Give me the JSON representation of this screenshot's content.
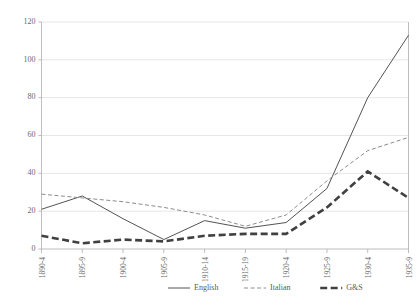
{
  "chart_data": {
    "type": "line",
    "title": "",
    "xlabel": "",
    "ylabel": "",
    "ylim": [
      0,
      120
    ],
    "yticks": [
      0,
      20,
      40,
      60,
      80,
      100,
      120
    ],
    "grid": true,
    "legend_position": "bottom",
    "categories": [
      "1890-4",
      "1895-9",
      "1900-4",
      "1905-9",
      "1910-14",
      "1915-19",
      "1920-4",
      "1925-9",
      "1930-4",
      "1935-9"
    ],
    "series": [
      {
        "name": "English",
        "style": "solid",
        "color": "#404040",
        "values": [
          21,
          28,
          16,
          5,
          15,
          11,
          14,
          32,
          80,
          113
        ]
      },
      {
        "name": "Italian",
        "style": "dashed",
        "color": "#8c8c8c",
        "values": [
          29,
          27,
          25,
          22,
          18,
          12,
          18,
          36,
          52,
          59
        ]
      },
      {
        "name": "G&S",
        "style": "thick-dashed",
        "color": "#404040",
        "values": [
          7,
          3,
          5,
          4,
          7,
          8,
          8,
          22,
          41,
          27
        ]
      }
    ]
  },
  "axes": {
    "y_tick_labels": [
      "0",
      "20",
      "40",
      "60",
      "80",
      "100",
      "120"
    ],
    "x_tick_labels": [
      "1890-4",
      "1895-9",
      "1900-4",
      "1905-9",
      "1910-14",
      "1915-19",
      "1920-4",
      "1925-9",
      "1930-4",
      "1935-9"
    ]
  },
  "legend": {
    "entries": [
      {
        "label": "English",
        "style": "solid"
      },
      {
        "label": "Italian",
        "style": "dashed"
      },
      {
        "label": "G&S",
        "style": "thick-dashed"
      }
    ]
  },
  "colors": {
    "english": "#404040",
    "italian": "#8c8c8c",
    "gands": "#404040",
    "grid": "#e0e0e0",
    "axis": "#b5b5b5",
    "text": "#6a6a6a",
    "background": "#ffffff"
  }
}
